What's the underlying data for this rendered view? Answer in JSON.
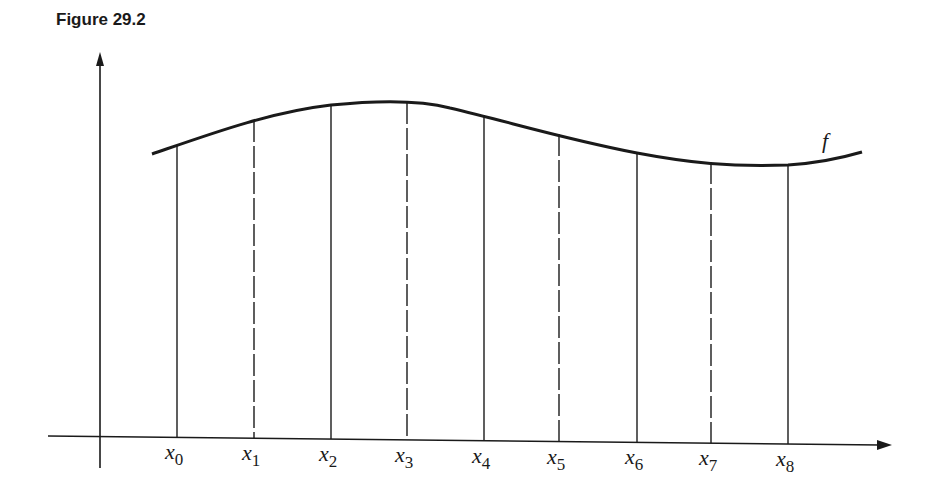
{
  "figure": {
    "caption": "Figure 29.2",
    "function_label": "f",
    "points": [
      {
        "label": "x",
        "sub": "0",
        "x": 177,
        "top": 145,
        "style": "solid"
      },
      {
        "label": "x",
        "sub": "1",
        "x": 254,
        "top": 120,
        "style": "dashed"
      },
      {
        "label": "x",
        "sub": "2",
        "x": 331,
        "top": 105,
        "style": "solid"
      },
      {
        "label": "x",
        "sub": "3",
        "x": 407,
        "top": 102,
        "style": "dashed"
      },
      {
        "label": "x",
        "sub": "4",
        "x": 484,
        "top": 115,
        "style": "solid"
      },
      {
        "label": "x",
        "sub": "5",
        "x": 559,
        "top": 134,
        "style": "dashed"
      },
      {
        "label": "x",
        "sub": "6",
        "x": 637,
        "top": 153,
        "style": "solid"
      },
      {
        "label": "x",
        "sub": "7",
        "x": 711,
        "top": 162,
        "style": "dashed"
      },
      {
        "label": "x",
        "sub": "8",
        "x": 788,
        "top": 165,
        "style": "solid"
      }
    ]
  }
}
